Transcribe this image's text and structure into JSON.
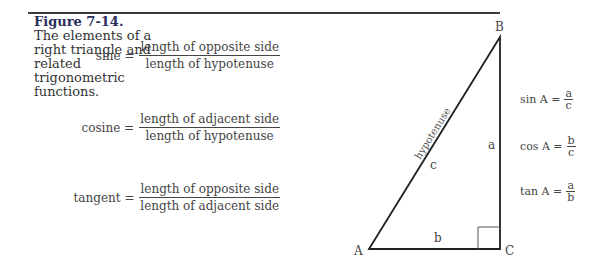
{
  "caption": {
    "title": "Figure 7-14.",
    "text": "The elements of a right triangle and related trigonometric functions."
  },
  "formulas": [
    {
      "name": "sine",
      "lhs": "sine =",
      "numerator": "length of opposite side",
      "denominator": "length of hypotenuse"
    },
    {
      "name": "cosine",
      "lhs": "cosine =",
      "numerator": "length of adjacent side",
      "denominator": "length of hypotenuse"
    },
    {
      "name": "tangent",
      "lhs": "tangent =",
      "numerator": "length of opposite side",
      "denominator": "length of adjacent side"
    }
  ],
  "triangle": {
    "vertices": {
      "A": "A",
      "B": "B",
      "C": "C"
    },
    "sides": {
      "a": "a",
      "b": "b",
      "c": "c"
    },
    "hypotenuse_label": "hypotenuse"
  },
  "ratios": [
    {
      "lhs": "sin A =",
      "numerator": "a",
      "denominator": "c"
    },
    {
      "lhs": "cos A =",
      "numerator": "b",
      "denominator": "c"
    },
    {
      "lhs": "tan A =",
      "numerator": "a",
      "denominator": "b"
    }
  ]
}
